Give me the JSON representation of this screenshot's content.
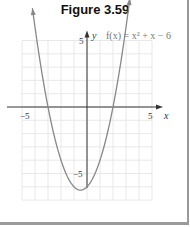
{
  "chart_data": {
    "type": "line",
    "title": "Figure 3.59",
    "function_label": "f(x) = x² + x − 6",
    "xlabel": "x",
    "ylabel": "y",
    "xlim": [
      -5,
      5
    ],
    "ylim": [
      -7,
      5
    ],
    "grid": true,
    "x_ticks": [
      {
        "value": -5,
        "label": "−5"
      },
      {
        "value": 5,
        "label": "5"
      }
    ],
    "y_ticks": [
      {
        "value": 5,
        "label": "5"
      },
      {
        "value": -5,
        "label": "−5"
      }
    ],
    "series": [
      {
        "name": "f(x) = x^2 + x - 6",
        "expression": "x^2 + x - 6",
        "x_range": [
          -4.2,
          3.3
        ],
        "color": "#888888",
        "arrows": true
      }
    ]
  }
}
